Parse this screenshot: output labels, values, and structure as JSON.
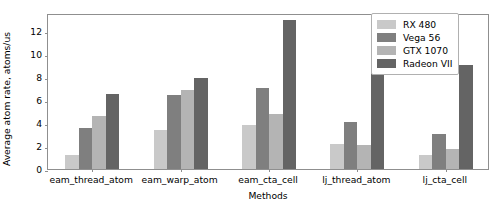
{
  "chart_data": {
    "type": "bar",
    "title": "",
    "xlabel": "Methods",
    "ylabel": "Average atom rate, atoms/us",
    "categories": [
      "eam_thread_atom",
      "eam_warp_atom",
      "eam_cta_cell",
      "lj_thread_atom",
      "lj_cta_cell"
    ],
    "series": [
      {
        "name": "RX 480",
        "color": "#c9c9c9",
        "values": [
          1.2,
          3.4,
          3.8,
          2.2,
          1.2
        ]
      },
      {
        "name": "Vega 56",
        "color": "#7f7f7f",
        "values": [
          3.6,
          6.4,
          7.0,
          4.1,
          3.0
        ]
      },
      {
        "name": "GTX 1070",
        "color": "#b4b4b4",
        "values": [
          4.6,
          6.9,
          4.8,
          2.1,
          1.7
        ]
      },
      {
        "name": "Radeon VII",
        "color": "#646464",
        "values": [
          6.5,
          7.9,
          12.9,
          11.3,
          9.0
        ]
      }
    ],
    "ylim": [
      0,
      13.55
    ],
    "yticks": [
      0,
      2,
      4,
      6,
      8,
      10,
      12
    ],
    "ytick_labels": [
      "0",
      "2",
      "4",
      "6",
      "8",
      "10",
      "12"
    ],
    "grid": false,
    "legend_position": "upper right"
  }
}
